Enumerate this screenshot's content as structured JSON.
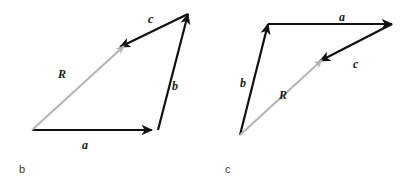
{
  "figure": {
    "background_color": "#ffffff",
    "vector_color": "#111111",
    "resultant_color": "#b4b4b4",
    "label_color": "#1a1a1a",
    "caption_color": "#3a3a3a",
    "panels": [
      {
        "caption": "b",
        "caption_x": 19,
        "caption_y": 164,
        "vectors": [
          {
            "name": "a",
            "label": "a",
            "kind": "component",
            "color": "#111111",
            "x1": 32,
            "y1": 130,
            "x2": 152,
            "y2": 130,
            "label_x": 82,
            "label_y": 139
          },
          {
            "name": "b",
            "label": "b",
            "kind": "component",
            "color": "#111111",
            "x1": 158,
            "y1": 130,
            "x2": 188,
            "y2": 14,
            "label_x": 172,
            "label_y": 80
          },
          {
            "name": "c",
            "label": "c",
            "kind": "component",
            "color": "#111111",
            "x1": 188,
            "y1": 14,
            "x2": 120,
            "y2": 47,
            "label_x": 148,
            "label_y": 13
          },
          {
            "name": "R",
            "label": "R",
            "kind": "resultant",
            "color": "#b4b4b4",
            "x1": 32,
            "y1": 130,
            "x2": 124,
            "y2": 46,
            "label_x": 58,
            "label_y": 68
          }
        ]
      },
      {
        "caption": "c",
        "caption_x": 225,
        "caption_y": 164,
        "vectors": [
          {
            "name": "b",
            "label": "b",
            "kind": "component",
            "color": "#111111",
            "x1": 240,
            "y1": 135,
            "x2": 268,
            "y2": 24,
            "label_x": 240,
            "label_y": 77
          },
          {
            "name": "a",
            "label": "a",
            "kind": "component",
            "color": "#111111",
            "x1": 268,
            "y1": 24,
            "x2": 392,
            "y2": 24,
            "label_x": 339,
            "label_y": 11
          },
          {
            "name": "c",
            "label": "c",
            "kind": "component",
            "color": "#111111",
            "x1": 392,
            "y1": 24,
            "x2": 320,
            "y2": 61,
            "label_x": 353,
            "label_y": 58
          },
          {
            "name": "R",
            "label": "R",
            "kind": "resultant",
            "color": "#b4b4b4",
            "x1": 240,
            "y1": 135,
            "x2": 322,
            "y2": 60,
            "label_x": 279,
            "label_y": 89
          }
        ]
      }
    ]
  }
}
